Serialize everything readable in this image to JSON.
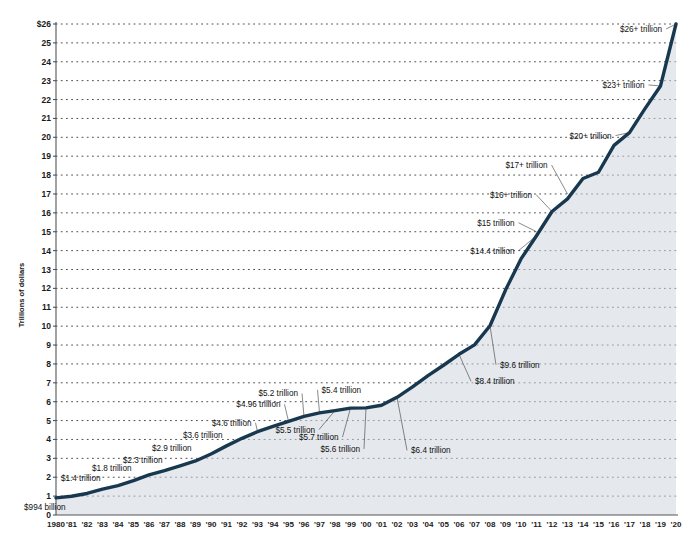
{
  "chart_data": {
    "type": "line",
    "title": "",
    "xlabel": "",
    "ylabel": "Trillions of dollars",
    "ylim": [
      0,
      26
    ],
    "xlim": [
      1980,
      2020
    ],
    "grid": true,
    "legend": "none",
    "line_color": "#17384f",
    "y_ticks": [
      "0",
      "1",
      "2",
      "3",
      "4",
      "5",
      "6",
      "7",
      "8",
      "9",
      "10",
      "11",
      "12",
      "13",
      "14",
      "15",
      "16",
      "17",
      "18",
      "19",
      "20",
      "21",
      "22",
      "23",
      "24",
      "25",
      "$26"
    ],
    "x_ticks": [
      "1980",
      "'81",
      "'82",
      "'83",
      "'84",
      "'85",
      "'86",
      "'87",
      "'88",
      "'89",
      "'90",
      "'91",
      "'92",
      "'93",
      "'94",
      "'95",
      "'96",
      "'97",
      "'98",
      "'99",
      "'00",
      "'01",
      "'02",
      "'03",
      "'04",
      "'05",
      "'06",
      "'07",
      "'08",
      "'09",
      "'10",
      "'11",
      "'12",
      "'13",
      "'14",
      "'15",
      "'16",
      "'17",
      "'18",
      "'19",
      "'20"
    ],
    "x": [
      1980,
      1981,
      1982,
      1983,
      1984,
      1985,
      1986,
      1987,
      1988,
      1989,
      1990,
      1991,
      1992,
      1993,
      1994,
      1995,
      1996,
      1997,
      1998,
      1999,
      2000,
      2001,
      2002,
      2003,
      2004,
      2005,
      2006,
      2007,
      2008,
      2009,
      2010,
      2011,
      2012,
      2013,
      2014,
      2015,
      2016,
      2017,
      2018,
      2019,
      2020
    ],
    "values": [
      0.909,
      0.994,
      1.14,
      1.37,
      1.56,
      1.82,
      2.12,
      2.35,
      2.6,
      2.86,
      3.23,
      3.66,
      4.06,
      4.41,
      4.69,
      4.96,
      5.22,
      5.41,
      5.53,
      5.66,
      5.67,
      5.81,
      6.23,
      6.78,
      7.38,
      7.93,
      8.51,
      9.01,
      10.02,
      11.91,
      13.56,
      14.79,
      16.07,
      16.74,
      17.82,
      18.15,
      19.57,
      20.25,
      21.52,
      22.72,
      26.0
    ],
    "annotations": [
      {
        "label": "$994 billion",
        "year": 1981,
        "value": 0.994
      },
      {
        "label": "$1.4 trillion",
        "year": 1983,
        "value": 1.37
      },
      {
        "label": "$1.8 trillion",
        "year": 1985,
        "value": 1.82
      },
      {
        "label": "$2.3 trillion",
        "year": 1987,
        "value": 2.35
      },
      {
        "label": "$2.9 trillion",
        "year": 1989,
        "value": 2.86
      },
      {
        "label": "$3.6 trillion",
        "year": 1991,
        "value": 3.66
      },
      {
        "label": "$4.6 trillion",
        "year": 1993,
        "value": 4.41
      },
      {
        "label": "$4.96 trillion",
        "year": 1995,
        "value": 4.96
      },
      {
        "label": "$5.2 trillion",
        "year": 1996,
        "value": 5.22
      },
      {
        "label": "$5.4 trillion",
        "year": 1997,
        "value": 5.41
      },
      {
        "label": "$5.5 trillion",
        "year": 1998,
        "value": 5.53
      },
      {
        "label": "$5.7 trillion",
        "year": 1999,
        "value": 5.66
      },
      {
        "label": "$5.6 trillion",
        "year": 2000,
        "value": 5.67
      },
      {
        "label": "$6.4 trillion",
        "year": 2002,
        "value": 6.23
      },
      {
        "label": "$8.4 trillion",
        "year": 2006,
        "value": 8.51
      },
      {
        "label": "$9.6 trillion",
        "year": 2008,
        "value": 10.02
      },
      {
        "label": "$14.4 trillion",
        "year": 2011,
        "value": 14.79
      },
      {
        "label": "$15 trillion",
        "year": 2011,
        "value": 15.0
      },
      {
        "label": "$16+ trillion",
        "year": 2012,
        "value": 16.07
      },
      {
        "label": "$17+ trillion",
        "year": 2013,
        "value": 17.0
      },
      {
        "label": "$20+ trillion",
        "year": 2017,
        "value": 20.25
      },
      {
        "label": "$23+ trillion",
        "year": 2019,
        "value": 22.72
      },
      {
        "label": "$26+ trillion",
        "year": 2020,
        "value": 26.0
      }
    ]
  }
}
